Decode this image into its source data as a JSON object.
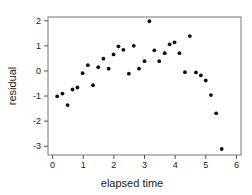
{
  "chart_data": {
    "type": "scatter",
    "title": "",
    "xlabel": "elapsed time",
    "ylabel": "residual",
    "xlim": [
      -0.15,
      6.15
    ],
    "ylim": [
      -3.35,
      2.15
    ],
    "xticks": [
      0,
      1,
      2,
      3,
      4,
      5,
      6
    ],
    "yticks": [
      -3,
      -2,
      -1,
      0,
      1,
      2
    ],
    "xtick_labels": [
      "0",
      "1",
      "2",
      "3",
      "4",
      "5",
      "6"
    ],
    "ytick_labels": [
      "-3",
      "-2",
      "-1",
      "0",
      "1",
      "2"
    ],
    "grid": false,
    "legend": null,
    "marker_color": "#111111",
    "series": [
      {
        "name": "residual",
        "points": [
          [
            0.15,
            -1.01
          ],
          [
            0.32,
            -0.9
          ],
          [
            0.49,
            -1.36
          ],
          [
            0.65,
            -0.74
          ],
          [
            0.81,
            -0.66
          ],
          [
            0.98,
            -0.09
          ],
          [
            1.15,
            0.23
          ],
          [
            1.32,
            -0.57
          ],
          [
            1.49,
            0.15
          ],
          [
            1.66,
            0.49
          ],
          [
            1.83,
            0.09
          ],
          [
            1.99,
            0.66
          ],
          [
            2.15,
            0.98
          ],
          [
            2.31,
            0.84
          ],
          [
            2.49,
            -0.11
          ],
          [
            2.65,
            1.0
          ],
          [
            2.82,
            0.09
          ],
          [
            3.0,
            0.39
          ],
          [
            3.16,
            1.98
          ],
          [
            3.32,
            0.82
          ],
          [
            3.48,
            0.39
          ],
          [
            3.66,
            0.71
          ],
          [
            3.82,
            1.06
          ],
          [
            3.98,
            1.14
          ],
          [
            4.14,
            0.71
          ],
          [
            4.32,
            -0.05
          ],
          [
            4.48,
            1.39
          ],
          [
            4.68,
            -0.06
          ],
          [
            4.84,
            -0.18
          ],
          [
            5.0,
            -0.38
          ],
          [
            5.17,
            -0.96
          ],
          [
            5.34,
            -1.69
          ],
          [
            5.52,
            -3.11
          ]
        ]
      }
    ]
  }
}
